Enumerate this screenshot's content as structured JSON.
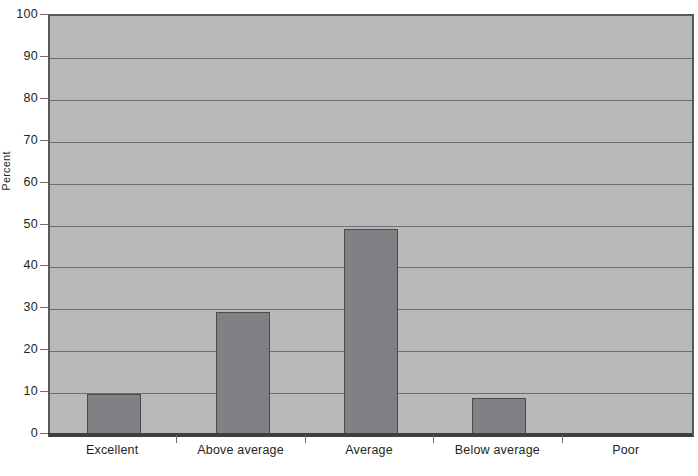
{
  "chart_data": {
    "type": "bar",
    "title": "",
    "xlabel": "",
    "ylabel": "Percent",
    "categories": [
      "Excellent",
      "Above average",
      "Average",
      "Below average",
      "Poor"
    ],
    "values": [
      9.8,
      29.4,
      49.2,
      8.9,
      0
    ],
    "ylim": [
      0,
      100
    ],
    "yticks": [
      0,
      10,
      20,
      30,
      40,
      50,
      60,
      70,
      80,
      90,
      100
    ],
    "ytick_labels": [
      "0",
      "10",
      "20",
      "30",
      "40",
      "50",
      "60",
      "70",
      "80",
      "90",
      "100"
    ],
    "grid": true,
    "legend": false,
    "legend_position": "none",
    "series": [
      {
        "name": "Percent",
        "values": [
          9.8,
          29.4,
          49.2,
          8.9,
          0
        ]
      }
    ],
    "colors": {
      "bar_fill": "#808184",
      "bar_edge": "#4a4b4d",
      "plot_background": "#b9b9b9",
      "gridline": "#6d6e70",
      "axis": "#3f3f3f",
      "text": "#231f20"
    }
  },
  "caption": {
    "text": ""
  }
}
